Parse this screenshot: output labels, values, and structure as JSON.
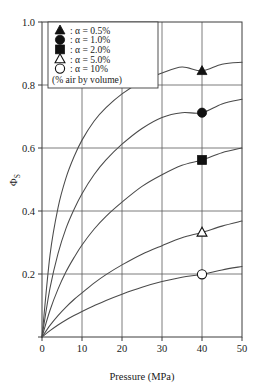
{
  "chart_data": {
    "type": "line",
    "title": "",
    "xlabel": "Pressure (MPa)",
    "ylabel": "Φs",
    "ylabel_base": "Φ",
    "ylabel_sub": "S",
    "xlim": [
      0,
      50
    ],
    "ylim": [
      0,
      1.0
    ],
    "xticks": [
      0,
      10,
      20,
      30,
      40,
      50
    ],
    "xtick_labels": [
      "0",
      "10",
      "20",
      "30",
      "40",
      "50"
    ],
    "yticks": [
      0.0,
      0.2,
      0.4,
      0.6,
      0.8,
      1.0
    ],
    "ytick_labels": [
      "0.2",
      "0.4",
      "0.6",
      "0.8",
      "1.0"
    ],
    "grid": true,
    "grid_x": [
      10,
      20,
      30,
      40
    ],
    "grid_y": [
      0.2,
      0.4,
      0.6,
      0.8
    ],
    "legend_position": "top-left",
    "legend_note": "(% air by volume)",
    "marker_x": 40,
    "series": [
      {
        "name": "α = 0.5%",
        "marker": "filled-triangle",
        "alpha": 0.5,
        "marker_value": 0.845,
        "x": [
          0,
          2,
          4,
          6,
          8,
          10,
          13,
          16,
          20,
          25,
          30,
          35,
          40,
          45,
          50
        ],
        "values": [
          0.0,
          0.26,
          0.41,
          0.505,
          0.572,
          0.625,
          0.685,
          0.728,
          0.772,
          0.812,
          0.838,
          0.857,
          0.845,
          0.866,
          0.872
        ]
      },
      {
        "name": "α = 1.0%",
        "marker": "filled-circle",
        "alpha": 1.0,
        "marker_value": 0.712,
        "x": [
          0,
          2,
          4,
          6,
          8,
          10,
          13,
          16,
          20,
          25,
          30,
          35,
          40,
          45,
          50
        ],
        "values": [
          0.0,
          0.155,
          0.265,
          0.345,
          0.405,
          0.455,
          0.515,
          0.562,
          0.612,
          0.662,
          0.697,
          0.712,
          0.712,
          0.74,
          0.755
        ]
      },
      {
        "name": "α = 2.0%",
        "marker": "filled-square",
        "alpha": 2.0,
        "marker_value": 0.562,
        "x": [
          0,
          2,
          4,
          6,
          8,
          10,
          13,
          16,
          20,
          25,
          30,
          35,
          40,
          45,
          50
        ],
        "values": [
          0.0,
          0.085,
          0.152,
          0.207,
          0.252,
          0.292,
          0.342,
          0.383,
          0.428,
          0.478,
          0.515,
          0.545,
          0.562,
          0.585,
          0.6
        ]
      },
      {
        "name": "α = 5.0%",
        "marker": "open-triangle",
        "alpha": 5.0,
        "marker_value": 0.332,
        "x": [
          0,
          2,
          4,
          6,
          8,
          10,
          13,
          16,
          20,
          25,
          30,
          35,
          40,
          45,
          50
        ],
        "values": [
          0.0,
          0.037,
          0.068,
          0.095,
          0.119,
          0.14,
          0.171,
          0.198,
          0.229,
          0.263,
          0.29,
          0.315,
          0.332,
          0.352,
          0.368
        ]
      },
      {
        "name": "α = 10%",
        "marker": "open-circle",
        "alpha": 10.0,
        "marker_value": 0.199,
        "x": [
          0,
          2,
          4,
          6,
          8,
          10,
          13,
          16,
          20,
          25,
          30,
          35,
          40,
          45,
          50
        ],
        "values": [
          0.0,
          0.02,
          0.038,
          0.054,
          0.068,
          0.081,
          0.099,
          0.116,
          0.136,
          0.158,
          0.176,
          0.19,
          0.199,
          0.213,
          0.224
        ]
      }
    ]
  },
  "legend": {
    "entries": [
      {
        "symbol": "filled-triangle",
        "label": ": α = 0.5%"
      },
      {
        "symbol": "filled-circle",
        "label": ": α = 1.0%"
      },
      {
        "symbol": "filled-square",
        "label": ": α = 2.0%"
      },
      {
        "symbol": "open-triangle",
        "label": ": α = 5.0%"
      },
      {
        "symbol": "open-circle",
        "label": ": α = 10%"
      }
    ],
    "note": "(% air by volume)"
  },
  "colors": {
    "curve": "#4a4a4a",
    "grid": "#5a5a5a",
    "axis": "#3d3d3d",
    "marker_fill": "#111111",
    "marker_open": "#ffffff",
    "background": "#ffffff"
  }
}
